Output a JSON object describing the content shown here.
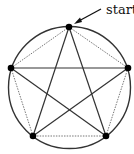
{
  "diagram": {
    "start_label": "start",
    "circle": {
      "cx": 69.5,
      "cy": 87.5,
      "r": 61
    },
    "vertices": [
      {
        "id": "top",
        "x": 69,
        "y": 27
      },
      {
        "id": "right",
        "x": 128,
        "y": 68
      },
      {
        "id": "bottom-right",
        "x": 106,
        "y": 136
      },
      {
        "id": "bottom-left",
        "x": 33,
        "y": 136
      },
      {
        "id": "left",
        "x": 11,
        "y": 68
      }
    ],
    "star_edges_solid": [
      [
        "top",
        "bottom-left"
      ],
      [
        "bottom-left",
        "right"
      ],
      [
        "right",
        "left"
      ],
      [
        "left",
        "bottom-right"
      ],
      [
        "bottom-right",
        "top"
      ]
    ],
    "pentagon_edges_dotted": [
      [
        "top",
        "right"
      ],
      [
        "right",
        "bottom-right"
      ],
      [
        "bottom-right",
        "bottom-left"
      ],
      [
        "bottom-left",
        "left"
      ],
      [
        "left",
        "top"
      ]
    ],
    "colors": {
      "stroke": "#333333",
      "dot": "#000000",
      "dotted": "#777777"
    }
  }
}
